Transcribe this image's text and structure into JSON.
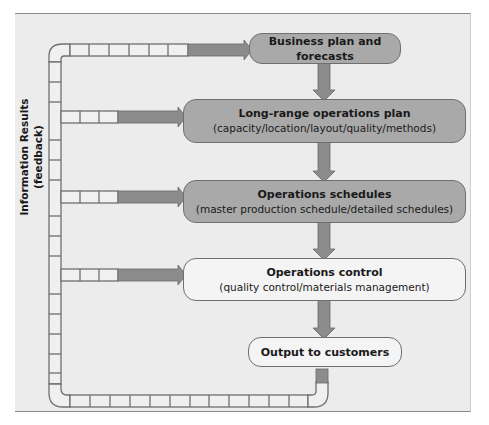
{
  "diagram": {
    "type": "flowchart",
    "side_label": {
      "line1": "Information Results",
      "line2": "(feedback)"
    },
    "boxes": [
      {
        "id": "business-plan",
        "title": "Business plan and",
        "title2": "forecasts",
        "subtitle": "",
        "style": "dark"
      },
      {
        "id": "long-range-plan",
        "title": "Long-range operations plan",
        "subtitle": "(capacity/location/layout/quality/methods)",
        "style": "dark"
      },
      {
        "id": "operations-schedules",
        "title": "Operations schedules",
        "subtitle": "(master production schedule/detailed schedules)",
        "style": "dark"
      },
      {
        "id": "operations-control",
        "title": "Operations control",
        "subtitle": "(quality control/materials management)",
        "style": "light"
      },
      {
        "id": "output",
        "title": "Output to customers",
        "subtitle": "",
        "style": "light"
      }
    ],
    "flows": [
      {
        "from": "business-plan",
        "to": "long-range-plan"
      },
      {
        "from": "long-range-plan",
        "to": "operations-schedules"
      },
      {
        "from": "operations-schedules",
        "to": "operations-control"
      },
      {
        "from": "operations-control",
        "to": "output"
      },
      {
        "from": "output",
        "to": "feedback-loop"
      },
      {
        "from": "feedback-loop",
        "to": "business-plan"
      },
      {
        "from": "feedback-loop",
        "to": "long-range-plan"
      },
      {
        "from": "feedback-loop",
        "to": "operations-schedules"
      },
      {
        "from": "feedback-loop",
        "to": "operations-control"
      }
    ],
    "colors": {
      "background": "#ececec",
      "dark_box": "#a9a9a9",
      "light_box": "#f4f4f4",
      "arrow": "#8c8c8c",
      "pipe_outline": "#6f6f6f"
    }
  }
}
